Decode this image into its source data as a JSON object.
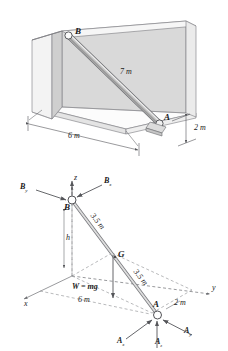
{
  "figure": {
    "background_color": "#ffffff",
    "ink_color": "#1a1a1a",
    "wall_fill": "#d9d9d9",
    "wall_edge_fill": "#f2f2f2",
    "floor_fill": "#fbfbfb",
    "bar_fill": "#b9b9b9"
  },
  "top_diagram": {
    "name": "pictorial-view",
    "points": {
      "B": "B",
      "A": "A"
    },
    "length_label": "7 m",
    "dim_horizontal": "6 m",
    "dim_depth": "2 m"
  },
  "bottom_diagram": {
    "name": "free-body-diagram",
    "points": {
      "B": "B",
      "A": "A",
      "G": "G"
    },
    "axes": {
      "x": "x",
      "y": "y",
      "z": "z"
    },
    "forces": {
      "Bx": {
        "base": "B",
        "sub": "x"
      },
      "By": {
        "base": "B",
        "sub": "y"
      },
      "Ax": {
        "base": "A",
        "sub": "x"
      },
      "Ay": {
        "base": "A",
        "sub": "y"
      },
      "Az": {
        "base": "A",
        "sub": "z"
      },
      "weight": "W = mg"
    },
    "dimensions": {
      "upper_half": "3.5 m",
      "lower_half": "3.5 m",
      "height": "h",
      "span": "6 m",
      "depth": "2 m"
    }
  }
}
